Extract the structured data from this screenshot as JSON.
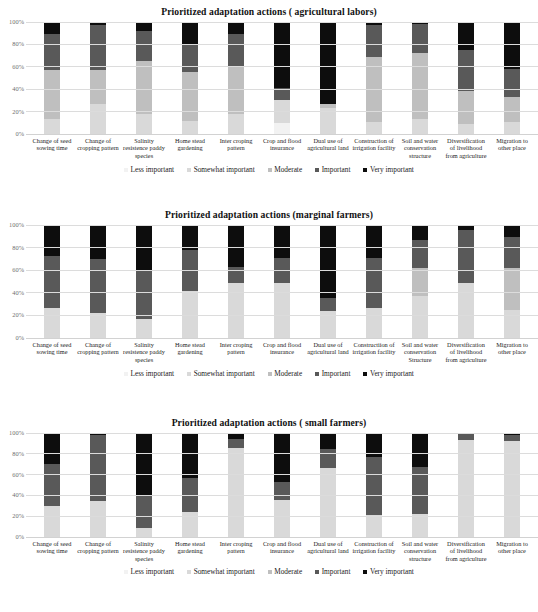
{
  "legend": {
    "items": [
      {
        "label": "Less important",
        "color": "#f2f2f2"
      },
      {
        "label": "Somewhat important",
        "color": "#d9d9d9"
      },
      {
        "label": "Moderate",
        "color": "#bfbfbf"
      },
      {
        "label": "Important",
        "color": "#595959"
      },
      {
        "label": "Very important",
        "color": "#0d0d0d"
      }
    ]
  },
  "axis": {
    "ticks": [
      "100%",
      "80%",
      "60%",
      "40%",
      "20%",
      "0%"
    ],
    "ylim": [
      0,
      100
    ]
  },
  "categories_a": [
    "Change of seed sowing time",
    "Change of cropping pattern",
    "Salinity resistence paddy species",
    "Home stead gardening",
    "Inter croping pattern",
    "Crop and flood insurance",
    "Dual use of agricultural land",
    "Construction of irrigation facility",
    "Soil and water conservation structure",
    "Diversification of livelihood from agriculture",
    "Migration to other place"
  ],
  "categories_b": [
    "Change of seed sowing time",
    "Change of cropping pattern",
    "Salinity resistence paddy species",
    "Home stead gardening",
    "Inter croping pattern",
    "Crop and flood insurance",
    "Dual use of agricultural land",
    "Constructiion of irrigation facility",
    "Soil and water conservation Structure",
    "Diversification of livelihood from agriculture",
    "Migration to other place"
  ],
  "categories_c": [
    "Change of seed sowing time",
    "Change of cropping pattern",
    "Salinity resistence paddy species",
    "Home stead gardening",
    "Inter croping pattern",
    "Crop and flood insurance",
    "Dual use of agricultural land",
    "Construction of irrigation facility",
    "Soil and water conservation structure",
    "Diversification of livelihood from agriculture",
    "Migration to other place"
  ],
  "chart_data": [
    {
      "type": "bar",
      "stacked": true,
      "title": "Prioritized adaptation actions ( agricultural labors)",
      "xlabel": "",
      "ylabel": "",
      "ylim": [
        0,
        100
      ],
      "grid": true,
      "legend_position": "bottom",
      "categories": [
        "Change of seed sowing time",
        "Change of cropping pattern",
        "Salinity resistence paddy species",
        "Home stead gardening",
        "Inter croping pattern",
        "Crop and flood insurance",
        "Dual use of agricultural land",
        "Construction of irrigation facility",
        "Soil and water conservation structure",
        "Diversification of livelihood from agriculture",
        "Migration to other place"
      ],
      "series": [
        {
          "name": "Less important",
          "color": "#f2f2f2",
          "values": [
            0,
            0,
            0,
            0,
            0,
            10,
            0,
            0,
            0,
            0,
            0
          ]
        },
        {
          "name": "Somewhat important",
          "color": "#d9d9d9",
          "values": [
            13,
            27,
            18,
            12,
            18,
            20,
            23,
            11,
            13,
            9,
            11
          ]
        },
        {
          "name": "Moderate",
          "color": "#bfbfbf",
          "values": [
            44,
            30,
            47,
            43,
            42,
            0,
            4,
            58,
            59,
            29,
            22
          ]
        },
        {
          "name": "Important",
          "color": "#595959",
          "values": [
            32,
            40,
            27,
            25,
            29,
            11,
            0,
            28,
            26,
            37,
            25
          ]
        },
        {
          "name": "Very important",
          "color": "#0d0d0d",
          "values": [
            11,
            3,
            8,
            20,
            11,
            59,
            73,
            3,
            2,
            25,
            42
          ]
        }
      ]
    },
    {
      "type": "bar",
      "stacked": true,
      "title": "Prioritized adaptation actions (marginal farmers)",
      "xlabel": "",
      "ylabel": "",
      "ylim": [
        0,
        100
      ],
      "grid": true,
      "legend_position": "bottom",
      "categories": [
        "Change of seed sowing time",
        "Change of cropping pattern",
        "Salinity resistence paddy species",
        "Home stead gardening",
        "Inter croping pattern",
        "Crop and flood insurance",
        "Dual use of agricultural land",
        "Constructiion of irrigation facility",
        "Soil and water conservation Structure",
        "Diversification of livelihood from agriculture",
        "Migration to other place"
      ],
      "series": [
        {
          "name": "Less important",
          "color": "#f2f2f2",
          "values": [
            0,
            0,
            0,
            0,
            0,
            0,
            0,
            0,
            0,
            0,
            0
          ]
        },
        {
          "name": "Somewhat important",
          "color": "#d9d9d9",
          "values": [
            27,
            22,
            17,
            42,
            49,
            49,
            24,
            27,
            37,
            49,
            25
          ]
        },
        {
          "name": "Moderate",
          "color": "#bfbfbf",
          "values": [
            0,
            0,
            0,
            0,
            0,
            0,
            0,
            0,
            25,
            0,
            37
          ]
        },
        {
          "name": "Important",
          "color": "#595959",
          "values": [
            46,
            48,
            42,
            36,
            14,
            22,
            11,
            44,
            25,
            47,
            27
          ]
        },
        {
          "name": "Very important",
          "color": "#0d0d0d",
          "values": [
            27,
            30,
            41,
            22,
            37,
            29,
            65,
            29,
            13,
            4,
            11
          ]
        }
      ]
    },
    {
      "type": "bar",
      "stacked": true,
      "title": "Prioritized adaptation actions ( small farmers)",
      "xlabel": "",
      "ylabel": "",
      "ylim": [
        0,
        100
      ],
      "grid": true,
      "legend_position": "bottom",
      "categories": [
        "Change of seed sowing time",
        "Change of cropping pattern",
        "Salinity resistence paddy species",
        "Home stead gardening",
        "Inter croping pattern",
        "Crop and flood insurance",
        "Dual use of agricultural land",
        "Construction of irrigation facility",
        "Soil and water conservation structure",
        "Diversification of livelihood from agriculture",
        "Migration to other place"
      ],
      "series": [
        {
          "name": "Less important",
          "color": "#f2f2f2",
          "values": [
            0,
            0,
            0,
            0,
            0,
            0,
            0,
            0,
            0,
            0,
            0
          ]
        },
        {
          "name": "Somewhat important",
          "color": "#d9d9d9",
          "values": [
            30,
            35,
            9,
            24,
            86,
            36,
            66,
            21,
            22,
            93,
            92
          ]
        },
        {
          "name": "Moderate",
          "color": "#bfbfbf",
          "values": [
            0,
            0,
            0,
            0,
            0,
            0,
            0,
            0,
            0,
            0,
            0
          ]
        },
        {
          "name": "Important",
          "color": "#595959",
          "values": [
            40,
            63,
            31,
            33,
            8,
            17,
            19,
            56,
            45,
            6,
            6
          ]
        },
        {
          "name": "Very important",
          "color": "#0d0d0d",
          "values": [
            30,
            2,
            60,
            43,
            6,
            47,
            15,
            23,
            33,
            1,
            2
          ]
        }
      ]
    }
  ]
}
